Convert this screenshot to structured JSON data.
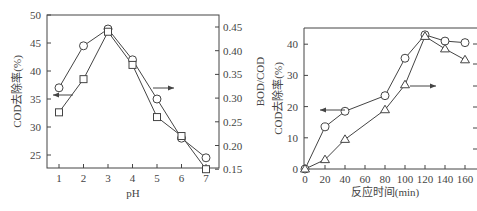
{
  "chart_data": [
    {
      "type": "line",
      "title": "",
      "xlabel": "pH",
      "ylabel": "COD去除率(%)",
      "y2label": "BOD/COD",
      "x": [
        1,
        2,
        3,
        4,
        5,
        6,
        7
      ],
      "xticks": [
        "1",
        "2",
        "3",
        "4",
        "5",
        "6",
        "7"
      ],
      "xlim": [
        0.5,
        7.5
      ],
      "ylim": [
        22.5,
        50
      ],
      "yticks": [
        "25",
        "30",
        "35",
        "40",
        "45",
        "50"
      ],
      "y2lim": [
        0.15,
        0.47
      ],
      "y2ticks": [
        "0.15",
        "0.20",
        "0.25",
        "0.30",
        "0.35",
        "0.40",
        "0.45"
      ],
      "series": [
        {
          "name": "COD去除率",
          "marker": "circle",
          "axis": "left",
          "values": [
            37,
            44.5,
            47.5,
            42,
            35,
            28,
            24.5
          ]
        },
        {
          "name": "BOD/COD",
          "marker": "square",
          "axis": "right",
          "values": [
            0.27,
            0.34,
            0.44,
            0.37,
            0.26,
            0.22,
            0.15
          ]
        }
      ],
      "annotations": [
        "left arrow → circles use left axis",
        "right arrow → squares use right axis"
      ],
      "grid": false
    },
    {
      "type": "line",
      "title": "",
      "xlabel": "反应时间(min)",
      "ylabel": "COD去除率(%)",
      "x": [
        0,
        20,
        40,
        80,
        100,
        120,
        140,
        160
      ],
      "xticks": [
        "0",
        "20",
        "40",
        "60",
        "80",
        "100",
        "120",
        "140",
        "160"
      ],
      "xlim": [
        -2,
        165
      ],
      "ylim": [
        0,
        45
      ],
      "yticks": [
        "0",
        "10",
        "20",
        "30",
        "40"
      ],
      "series": [
        {
          "name": "COD去除率",
          "marker": "circle",
          "axis": "left",
          "values": [
            0,
            13.5,
            18.5,
            23.5,
            35.5,
            43,
            41,
            40.5
          ]
        },
        {
          "name": "BOD/COD",
          "marker": "triangle",
          "axis": "right",
          "values": [
            0,
            3,
            9.5,
            19,
            27,
            42.5,
            38.5,
            35
          ]
        }
      ],
      "annotations": [
        "left arrow → circles use left axis",
        "right arrow → triangles use right axis (cut off)"
      ],
      "grid": false
    }
  ]
}
